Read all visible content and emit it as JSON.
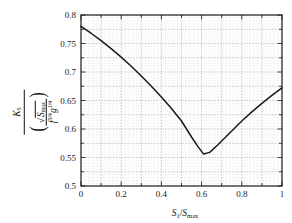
{
  "chart_data": {
    "type": "line",
    "title": "",
    "xlabel": "S_1 / S_max",
    "ylabel": "K_S / ( sqrt(S_max) / (f^{3/4} g^{1/4}) )",
    "xlim": [
      0,
      1
    ],
    "ylim": [
      0.5,
      0.8
    ],
    "grid": true,
    "minor_grid": true,
    "legend": "none",
    "line_color": "#1a1a1a",
    "x_ticks": [
      "0",
      "0.2",
      "0.4",
      "0.6",
      "0.8",
      "1"
    ],
    "x_tick_values": [
      0,
      0.2,
      0.4,
      0.6,
      0.8,
      1
    ],
    "y_ticks": [
      "0.5",
      "0.55",
      "0.6",
      "0.65",
      "0.7",
      "0.75",
      "0.8"
    ],
    "y_tick_values": [
      0.5,
      0.55,
      0.6,
      0.65,
      0.7,
      0.75,
      0.8
    ],
    "series": [
      {
        "name": "Ks curve",
        "x": [
          0.0,
          0.05,
          0.1,
          0.15,
          0.2,
          0.25,
          0.3,
          0.35,
          0.4,
          0.45,
          0.5,
          0.55,
          0.58,
          0.61,
          0.64,
          0.68,
          0.72,
          0.76,
          0.8,
          0.85,
          0.9,
          0.95,
          1.0
        ],
        "y": [
          0.78,
          0.768,
          0.755,
          0.741,
          0.726,
          0.71,
          0.693,
          0.675,
          0.656,
          0.636,
          0.614,
          0.586,
          0.57,
          0.556,
          0.559,
          0.572,
          0.586,
          0.6,
          0.614,
          0.63,
          0.645,
          0.659,
          0.672
        ]
      }
    ]
  },
  "axes": {
    "x_label_parts": {
      "var": "S",
      "sub": "1",
      "slash": "/",
      "var2": "S",
      "sub2": "max"
    },
    "y_label_parts": {
      "numerator_var": "K",
      "numerator_sub": "S",
      "sqrt_var": "S",
      "sqrt_sub": "max",
      "den_f": "f",
      "den_f_sup": "3/4",
      "den_g": "g",
      "den_g_sup": "1/4"
    }
  },
  "style": {
    "background": "#ffffff",
    "frame_color": "#111111",
    "major_grid_color": "#9a9a9a",
    "minor_grid_color": "#d2d2d2",
    "curve_color": "#1a1a1a"
  }
}
